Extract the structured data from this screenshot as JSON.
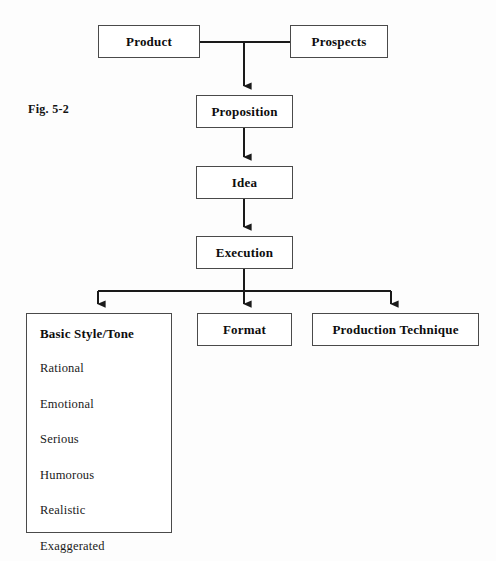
{
  "figure": {
    "label": "Fig. 5-2",
    "caption_position": "left-middle"
  },
  "diagram": {
    "type": "flowchart",
    "orientation": "top-down",
    "nodes": [
      {
        "id": "product",
        "label": "Product",
        "x": 98,
        "y": 25,
        "w": 102,
        "h": 33
      },
      {
        "id": "prospects",
        "label": "Prospects",
        "x": 290,
        "y": 25,
        "w": 98,
        "h": 33
      },
      {
        "id": "proposition",
        "label": "Proposition",
        "x": 196,
        "y": 95,
        "w": 97,
        "h": 33
      },
      {
        "id": "idea",
        "label": "Idea",
        "x": 196,
        "y": 166,
        "w": 97,
        "h": 33
      },
      {
        "id": "execution",
        "label": "Execution",
        "x": 196,
        "y": 236,
        "w": 97,
        "h": 33
      },
      {
        "id": "format",
        "label": "Format",
        "x": 197,
        "y": 313,
        "w": 95,
        "h": 33
      },
      {
        "id": "production",
        "label": "Production Technique",
        "x": 312,
        "y": 313,
        "w": 167,
        "h": 33
      }
    ],
    "style_panel": {
      "id": "basic-style-tone",
      "title": "Basic Style/Tone",
      "x": 26,
      "y": 313,
      "w": 146,
      "h": 220,
      "items": [
        "Rational",
        "Emotional",
        "Serious",
        "Humorous",
        "Realistic",
        "Exaggerated"
      ]
    },
    "connectors": {
      "stroke_color": "#1a1a1a",
      "stroke_width": 2,
      "merge_bar_y": 41,
      "distribution_bar_y": 290,
      "branch_x_positions": [
        98,
        244,
        391
      ],
      "trunk_x": 244
    }
  }
}
